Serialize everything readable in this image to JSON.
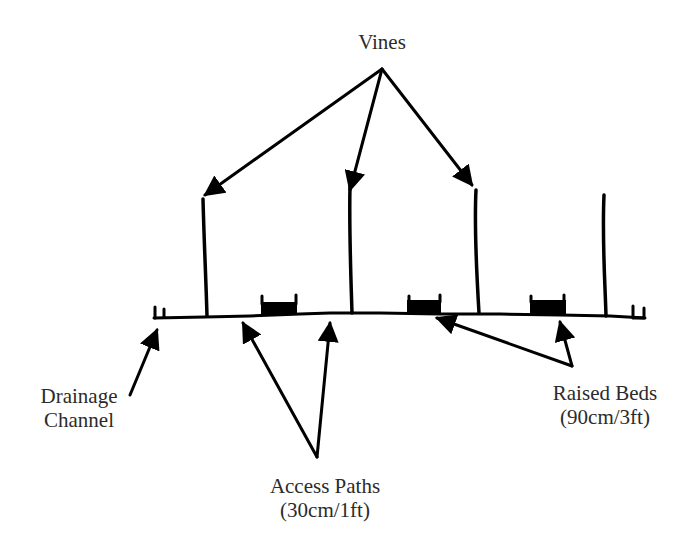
{
  "diagram": {
    "labels": {
      "vines": "Vines",
      "drainage_line1": "Drainage",
      "drainage_line2": "Channel",
      "raised_beds_line1": "Raised Beds",
      "raised_beds_line2": "(90cm/3ft)",
      "access_paths_line1": "Access Paths",
      "access_paths_line2": "(30cm/1ft)"
    },
    "elements": {
      "vine_count": 4,
      "raised_bed_count": 3,
      "drainage_channel_count": 2
    },
    "colors": {
      "ink": "#000000",
      "text": "#2b2b2b",
      "background": "#ffffff"
    }
  }
}
